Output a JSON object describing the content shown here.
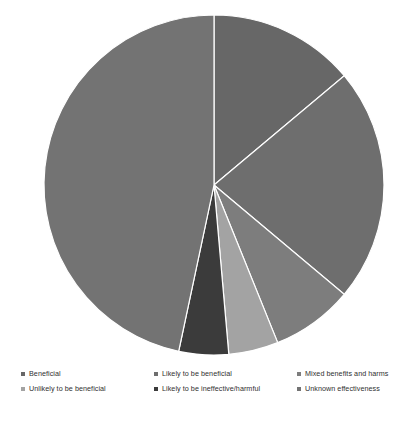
{
  "chart_data": {
    "type": "pie",
    "title": "",
    "subtitle": "",
    "xlabel": "",
    "ylabel": "",
    "grid": false,
    "legend_position": "bottom",
    "start_angle_deg": 0,
    "direction": "clockwise",
    "center": {
      "cx": 214,
      "cy": 185,
      "r": 170
    },
    "categories": [
      "Beneficial",
      "Likely to be beneficial",
      "Mixed benefits and harms",
      "Unlikely to be beneficial",
      "Likely to be ineffective/harmful",
      "Unknown effectiveness"
    ],
    "values": [
      13.9,
      22.2,
      7.8,
      4.7,
      4.7,
      46.7
    ],
    "slices": [
      {
        "label": "Beneficial",
        "value": 13.9,
        "start_deg": 0,
        "end_deg": 50,
        "color": "#676767"
      },
      {
        "label": "Likely to be beneficial",
        "value": 22.2,
        "start_deg": 50,
        "end_deg": 130,
        "color": "#6e6e6e"
      },
      {
        "label": "Mixed benefits and harms",
        "value": 7.8,
        "start_deg": 130,
        "end_deg": 158,
        "color": "#7d7d7d"
      },
      {
        "label": "Unlikely to be beneficial",
        "value": 4.7,
        "start_deg": 158,
        "end_deg": 175,
        "color": "#a3a3a3"
      },
      {
        "label": "Likely to be ineffective/harmful",
        "value": 4.7,
        "start_deg": 175,
        "end_deg": 192,
        "color": "#3b3b3b"
      },
      {
        "label": "Unknown effectiveness",
        "value": 46.7,
        "start_deg": 192,
        "end_deg": 360,
        "color": "#737373"
      }
    ],
    "slice_border_color": "#ffffff",
    "background_color": "#ffffff"
  },
  "legend": {
    "items": [
      {
        "label": "Beneficial",
        "color": "#676767"
      },
      {
        "label": "Likely to be beneficial",
        "color": "#6e6e6e"
      },
      {
        "label": "Mixed benefits and harms",
        "color": "#7d7d7d"
      },
      {
        "label": "Unlikely to be beneficial",
        "color": "#a3a3a3"
      },
      {
        "label": "Likely to be ineffective/harmful",
        "color": "#3b3b3b"
      },
      {
        "label": "Unknown effectiveness",
        "color": "#737373"
      }
    ]
  }
}
